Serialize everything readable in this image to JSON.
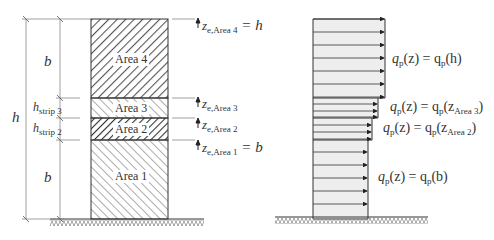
{
  "left_figure": {
    "areas": [
      {
        "label": "Area 4"
      },
      {
        "label": "Area 3"
      },
      {
        "label": "Area 2"
      },
      {
        "label": "Area 1"
      }
    ],
    "dimensions": {
      "top_b": "b",
      "h": "h",
      "h_strip_3": {
        "main": "h",
        "sub": "strip 3"
      },
      "h_strip_2": {
        "main": "h",
        "sub": "strip 2"
      },
      "bottom_b": "b"
    },
    "z_labels": [
      {
        "main": "z",
        "sub": "e,Area 4",
        "rhs": " = h"
      },
      {
        "main": "z",
        "sub": "e,Area 3",
        "rhs": ""
      },
      {
        "main": "z",
        "sub": "e,Area 2",
        "rhs": ""
      },
      {
        "main": "z",
        "sub": "e,Area 1",
        "rhs": " = b"
      }
    ]
  },
  "right_figure": {
    "profile_labels": [
      {
        "lhs": "q",
        "lsub": "p",
        "mid": "(z) = q",
        "rsub": "p",
        "arg": "(h)",
        "argsub": ""
      },
      {
        "lhs": "q",
        "lsub": "p",
        "mid": "(z) = q",
        "rsub": "p",
        "arg": "(z",
        "argsub": "Area 3",
        "close": ")"
      },
      {
        "lhs": "q",
        "lsub": "p",
        "mid": "(z) = q",
        "rsub": "p",
        "arg": "(z",
        "argsub": "Area 2",
        "close": ")"
      },
      {
        "lhs": "q",
        "lsub": "p",
        "mid": "(z) = q",
        "rsub": "p",
        "arg": "(b)",
        "argsub": ""
      }
    ]
  },
  "colors": {
    "line": "#333333",
    "hatch": "#555555",
    "profile_fill": "#eeeeee",
    "dim_line": "#888888"
  }
}
